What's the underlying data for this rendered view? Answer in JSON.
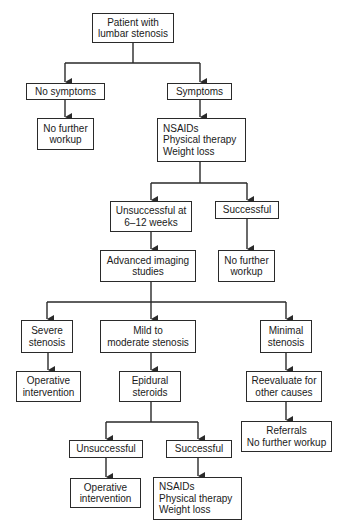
{
  "diagram": {
    "type": "flowchart",
    "nodes": {
      "start": [
        "Patient with",
        "lumbar stenosis"
      ],
      "no_symptoms": [
        "No symptoms"
      ],
      "symptoms": [
        "Symptoms"
      ],
      "no_further_workup_1": [
        "No further",
        "workup"
      ],
      "conservative_1": [
        "NSAIDs",
        "Physical therapy",
        "Weight loss"
      ],
      "unsuccessful_6_12": [
        "Unsuccessful at",
        "6–12 weeks"
      ],
      "successful_1": [
        "Successful"
      ],
      "advanced_imaging": [
        "Advanced imaging",
        "studies"
      ],
      "no_further_workup_2": [
        "No further",
        "workup"
      ],
      "severe": [
        "Severe",
        "stenosis"
      ],
      "mild_moderate": [
        "Mild to",
        "moderate stenosis"
      ],
      "minimal": [
        "Minimal",
        "stenosis"
      ],
      "operative_1": [
        "Operative",
        "intervention"
      ],
      "epidural": [
        "Epidural",
        "steroids"
      ],
      "reevaluate": [
        "Reevaluate for",
        "other causes"
      ],
      "referrals": [
        "Referrals",
        "No further workup"
      ],
      "unsuccessful_2": [
        "Unsuccessful"
      ],
      "successful_2": [
        "Successful"
      ],
      "operative_2": [
        "Operative",
        "intervention"
      ],
      "conservative_2": [
        "NSAIDs",
        "Physical therapy",
        "Weight loss"
      ]
    },
    "edges": [
      [
        "start",
        "no_symptoms"
      ],
      [
        "start",
        "symptoms"
      ],
      [
        "no_symptoms",
        "no_further_workup_1"
      ],
      [
        "symptoms",
        "conservative_1"
      ],
      [
        "conservative_1",
        "unsuccessful_6_12"
      ],
      [
        "conservative_1",
        "successful_1"
      ],
      [
        "unsuccessful_6_12",
        "advanced_imaging"
      ],
      [
        "successful_1",
        "no_further_workup_2"
      ],
      [
        "advanced_imaging",
        "severe"
      ],
      [
        "advanced_imaging",
        "mild_moderate"
      ],
      [
        "advanced_imaging",
        "minimal"
      ],
      [
        "severe",
        "operative_1"
      ],
      [
        "mild_moderate",
        "epidural"
      ],
      [
        "minimal",
        "reevaluate"
      ],
      [
        "reevaluate",
        "referrals"
      ],
      [
        "epidural",
        "unsuccessful_2"
      ],
      [
        "epidural",
        "successful_2"
      ],
      [
        "unsuccessful_2",
        "operative_2"
      ],
      [
        "successful_2",
        "conservative_2"
      ]
    ],
    "colors": {
      "line": "#2a2a2a",
      "background": "#ffffff",
      "text": "#1a1a1a"
    }
  }
}
